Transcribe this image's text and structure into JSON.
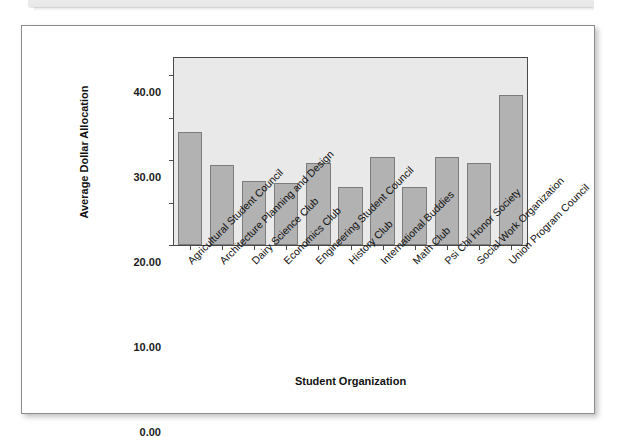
{
  "page": {
    "background_color": "#ffffff",
    "top_band_color": "#ebebeb"
  },
  "figure": {
    "card_border_color": "#8d8d8d",
    "plot_background_color": "#e9e9e9",
    "axis_color": "#4a4a4a",
    "bar_fill_color": "#b2b2b2",
    "bar_border_color": "#7c7c7c"
  },
  "chart_data": {
    "type": "bar",
    "title": "",
    "xlabel": "Student Organization",
    "ylabel": "Average Dollar Allocation",
    "ylim": [
      0,
      44
    ],
    "ytick_values": [
      0,
      10,
      20,
      30,
      40
    ],
    "ytick_labels": [
      "0.00",
      "10.00",
      "20.00",
      "30.00",
      "40.00"
    ],
    "grid": false,
    "legend": false,
    "categories": [
      "Agricultural Student Council",
      "Architecture Planning and Design",
      "Dairy Science Club",
      "Economics Club",
      "Engineering Student Council",
      "History Club",
      "International Buddies",
      "Math Club",
      "Psi Chi Honor Society",
      "Social Work Organization",
      "Union Program Council"
    ],
    "values": [
      26.6,
      18.8,
      15.1,
      14.7,
      19.2,
      13.6,
      20.6,
      13.6,
      20.6,
      19.3,
      35.2
    ]
  }
}
